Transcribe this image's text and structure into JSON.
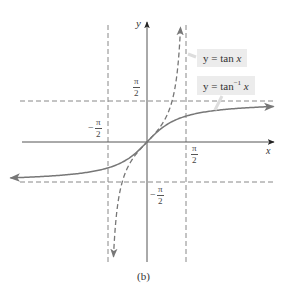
{
  "chart_data": {
    "type": "line",
    "title": "",
    "xlabel": "x",
    "ylabel": "y",
    "caption": "(b)",
    "series": [
      {
        "name": "y = tan x",
        "function": "tan",
        "style": "dashed",
        "domain": [
          -1.5,
          1.5
        ]
      },
      {
        "name": "y = tan^-1 x",
        "function": "arctan",
        "style": "solid",
        "domain": [
          -5.5,
          5.1
        ]
      }
    ],
    "asymptotes": {
      "vertical": [
        "-π/2",
        "π/2"
      ],
      "horizontal": [
        "-π/2",
        "π/2"
      ]
    },
    "x_ticks": [
      "-π/2",
      "π/2"
    ],
    "y_ticks": [
      "-π/2",
      "π/2"
    ],
    "legend": [
      "y = tan x",
      "y = tan⁻¹ x"
    ],
    "grid": false
  },
  "labels": {
    "x_axis": "x",
    "y_axis": "y",
    "pi": "π",
    "two": "2",
    "minus": "−",
    "legend_tan_prefix": "y = tan ",
    "legend_tan_var": "x",
    "legend_arctan_prefix": "y = tan",
    "legend_arctan_sup": "−1",
    "legend_arctan_var": " x",
    "caption": "(b)"
  },
  "colors": {
    "axis": "#333333",
    "curve": "#777777",
    "dash": "#888888",
    "legend_bg": "#ececec"
  }
}
